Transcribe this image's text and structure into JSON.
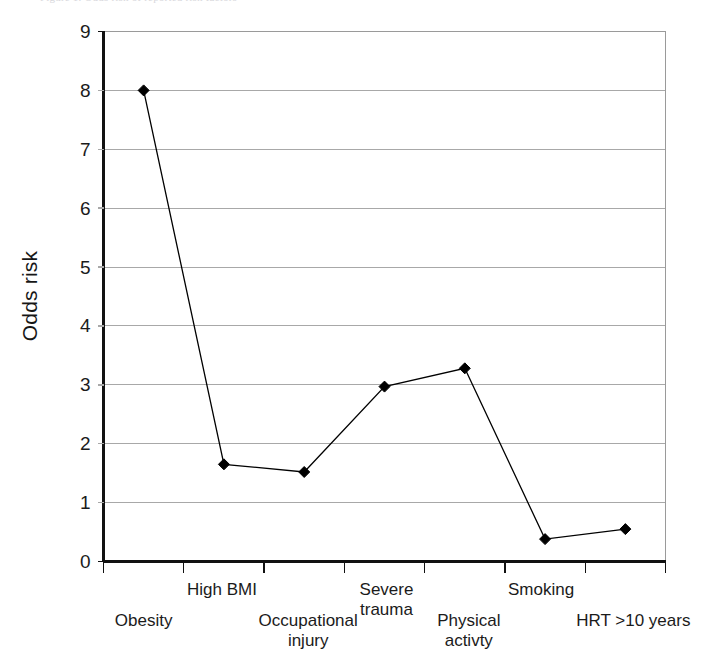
{
  "figure": {
    "top_caption_sliver": "Figure 1. Odds risk of reported risk factors",
    "background_color": "#ffffff",
    "plot_border_color": "#9a9a9a",
    "gridline_color": "#a8a8a8",
    "axis_color": "#111111",
    "series_color": "#000000"
  },
  "chart_data": {
    "type": "line",
    "title": "",
    "subtitle": "",
    "xlabel": "",
    "ylabel": "Odds risk",
    "categories": [
      "Obesity",
      "High BMI",
      "Occupational injury",
      "Severe trauma",
      "Physical activty",
      "Smoking",
      "HRT >10 years"
    ],
    "category_labels_display": [
      "Obesity",
      "High BMI",
      "Occupational\ninjury",
      "Severe\ntrauma",
      "Physical\nactivty",
      "Smoking",
      "HRT >10 years"
    ],
    "values": [
      8.0,
      1.65,
      1.52,
      2.97,
      3.28,
      0.38,
      0.55
    ],
    "ylim": [
      0,
      9
    ],
    "yticks": [
      0,
      1,
      2,
      3,
      4,
      5,
      6,
      7,
      8,
      9
    ],
    "ytick_labels": [
      "0",
      "1",
      "2",
      "3",
      "4",
      "5",
      "6",
      "7",
      "8",
      "9"
    ],
    "grid": true,
    "grid_axis": "y",
    "legend": false,
    "legend_position": "none",
    "marker": "diamond",
    "marker_size": 11,
    "line_width": 1.3
  }
}
